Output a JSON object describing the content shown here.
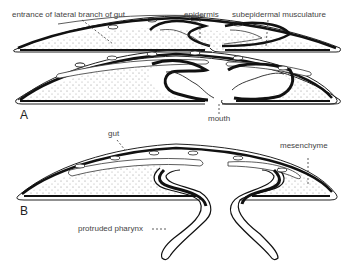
{
  "figure": {
    "panel_a": {
      "letter": "A",
      "labels": {
        "lateral_branch": "entrance of lateral branch of gut",
        "epidermis": "epidermis",
        "musculature": "subepidermal musculature",
        "mouth": "mouth"
      }
    },
    "panel_b": {
      "letter": "B",
      "labels": {
        "gut": "gut",
        "mesenchyme": "mesenchyme",
        "pharynx": "protruded pharynx"
      }
    }
  }
}
